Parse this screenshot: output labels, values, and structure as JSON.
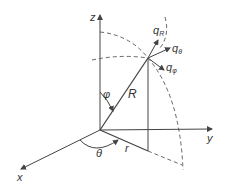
{
  "diagram": {
    "axes": {
      "x": "x",
      "y": "y",
      "z": "z"
    },
    "labels": {
      "radius": "R",
      "projection": "r",
      "polar_angle": "φ",
      "azimuth_angle": "θ"
    },
    "flux": {
      "qR": {
        "base": "q",
        "sub": "R"
      },
      "qtheta": {
        "base": "q",
        "sub": "θ"
      },
      "qphi": {
        "base": "q",
        "sub": "φ"
      }
    },
    "colors": {
      "line": "#444444",
      "dashed": "#555555",
      "text": "#333333"
    }
  }
}
